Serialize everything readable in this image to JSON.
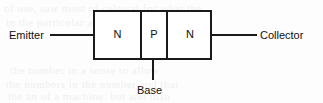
{
  "diagram": {
    "type": "npn-bipolar-junction-transistor-structure",
    "regions": [
      {
        "label": "N"
      },
      {
        "label": "P"
      },
      {
        "label": "N"
      }
    ],
    "terminals": {
      "emitter": "Emitter",
      "base": "Base",
      "collector": "Collector"
    },
    "colors": {
      "outline": "#1a1a1a",
      "text": "#111111",
      "background": "#fdfdfd",
      "device_fill": "#ffffff"
    }
  },
  "background_ghost_text": {
    "line1": "of use, saw most of cultural for what the",
    "line2": "in the particular and in that. The series",
    "line3": "the number in a sense to allow",
    "line4": "the numbers in the number and that",
    "line5": "the an of a machine. but and than"
  }
}
